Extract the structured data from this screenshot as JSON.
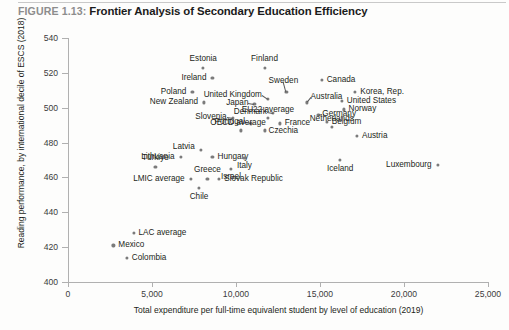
{
  "figure": {
    "label": "FIGURE 1.13:",
    "title": "Frontier Analysis of Secondary Education Efficiency"
  },
  "chart_data": {
    "type": "scatter",
    "title": "Frontier Analysis of Secondary Education Efficiency",
    "xlabel": "Total expenditure per full-time equivalent student by level of education (2019)",
    "ylabel": "Reading performance, by international decile of ESCS (2018)",
    "xlim": [
      0,
      25000
    ],
    "ylim": [
      400,
      540
    ],
    "xticks": [
      "0",
      "5,000",
      "10,000",
      "15,000",
      "20,000",
      "25,000"
    ],
    "xtick_values": [
      0,
      5000,
      10000,
      15000,
      20000,
      25000
    ],
    "yticks": [
      "400",
      "420",
      "440",
      "460",
      "480",
      "500",
      "520",
      "540"
    ],
    "ytick_values": [
      400,
      420,
      440,
      460,
      480,
      500,
      520,
      540
    ],
    "grid": false,
    "legend": null,
    "marker_color": "#7b7b7b",
    "points": [
      {
        "name": "Estonia",
        "x": 8050,
        "y": 523,
        "label_dx": 0,
        "label_dy": -9,
        "align": "c",
        "leader": false
      },
      {
        "name": "Finland",
        "x": 11700,
        "y": 523,
        "label_dx": 0,
        "label_dy": -9,
        "align": "c",
        "leader": false
      },
      {
        "name": "Ireland",
        "x": 8600,
        "y": 517,
        "label_dx": -6,
        "label_dy": 0,
        "align": "r",
        "leader": false
      },
      {
        "name": "Canada",
        "x": 15100,
        "y": 516,
        "label_dx": 5,
        "label_dy": 0,
        "align": "l",
        "leader": false
      },
      {
        "name": "Korea, Rep.",
        "x": 17100,
        "y": 509,
        "label_dx": 5,
        "label_dy": 0,
        "align": "l",
        "leader": false
      },
      {
        "name": "Poland",
        "x": 7400,
        "y": 509,
        "label_dx": -6,
        "label_dy": 0,
        "align": "r",
        "leader": false
      },
      {
        "name": "Sweden",
        "x": 13000,
        "y": 509,
        "label_dx": -3,
        "label_dy": -11,
        "align": "c",
        "leader": true
      },
      {
        "name": "United Kingdom",
        "x": 11900,
        "y": 505,
        "label_dx": -6,
        "label_dy": -4,
        "align": "r",
        "leader": true
      },
      {
        "name": "United States",
        "x": 16300,
        "y": 504,
        "label_dx": 5,
        "label_dy": 0,
        "align": "l",
        "leader": false
      },
      {
        "name": "New Zealand",
        "x": 8100,
        "y": 503,
        "label_dx": -6,
        "label_dy": 0,
        "align": "r",
        "leader": false
      },
      {
        "name": "Australia",
        "x": 14200,
        "y": 503,
        "label_dx": 4,
        "label_dy": -5,
        "align": "l",
        "leader": true
      },
      {
        "name": "Japan",
        "x": 11100,
        "y": 502,
        "label_dx": -6,
        "label_dy": -1,
        "align": "r",
        "leader": true
      },
      {
        "name": "Norway",
        "x": 16400,
        "y": 499,
        "label_dx": 5,
        "label_dy": 0,
        "align": "l",
        "leader": false
      },
      {
        "name": "Denmark",
        "x": 12200,
        "y": 497,
        "label_dx": -6,
        "label_dy": -1,
        "align": "r",
        "leader": true
      },
      {
        "name": "Germany",
        "x": 14900,
        "y": 496,
        "label_dx": 4,
        "label_dy": -1,
        "align": "l",
        "leader": true
      },
      {
        "name": "EU22 average",
        "x": 11900,
        "y": 494,
        "label_dx": 0,
        "label_dy": -8,
        "align": "c",
        "leader": false
      },
      {
        "name": "Slovenia",
        "x": 9800,
        "y": 494,
        "label_dx": -6,
        "label_dy": -1,
        "align": "r",
        "leader": true
      },
      {
        "name": "Belgium",
        "x": 15400,
        "y": 492,
        "label_dx": 5,
        "label_dy": 0,
        "align": "l",
        "leader": false
      },
      {
        "name": "Portugal",
        "x": 10900,
        "y": 491,
        "label_dx": -6,
        "label_dy": -1,
        "align": "r",
        "leader": true
      },
      {
        "name": "France",
        "x": 12600,
        "y": 491,
        "label_dx": 5,
        "label_dy": 0,
        "align": "l",
        "leader": false
      },
      {
        "name": "Netherlands",
        "x": 15700,
        "y": 489,
        "label_dx": 0,
        "label_dy": -8,
        "align": "c",
        "leader": false
      },
      {
        "name": "Czechia",
        "x": 11700,
        "y": 487,
        "label_dx": 4,
        "label_dy": 1,
        "align": "l",
        "leader": false
      },
      {
        "name": "OECD average",
        "x": 10300,
        "y": 487,
        "label_dx": -3,
        "label_dy": -7,
        "align": "c",
        "leader": false
      },
      {
        "name": "Austria",
        "x": 17200,
        "y": 484,
        "label_dx": 5,
        "label_dy": 0,
        "align": "l",
        "leader": false
      },
      {
        "name": "Latvia",
        "x": 7900,
        "y": 476,
        "label_dx": -6,
        "label_dy": -3,
        "align": "r",
        "leader": false
      },
      {
        "name": "Lithuania",
        "x": 6700,
        "y": 472,
        "label_dx": -6,
        "label_dy": 0,
        "align": "r",
        "leader": false
      },
      {
        "name": "Hungary",
        "x": 8600,
        "y": 472,
        "label_dx": 5,
        "label_dy": 0,
        "align": "l",
        "leader": false
      },
      {
        "name": "Italy",
        "x": 10500,
        "y": 471,
        "label_dx": 0,
        "label_dy": 8,
        "align": "c",
        "leader": false
      },
      {
        "name": "Iceland",
        "x": 16200,
        "y": 470,
        "label_dx": 0,
        "label_dy": 9,
        "align": "c",
        "leader": false
      },
      {
        "name": "Luxembourg",
        "x": 22000,
        "y": 467,
        "label_dx": -6,
        "label_dy": 0,
        "align": "r",
        "leader": false
      },
      {
        "name": "Türkiye",
        "x": 5200,
        "y": 466,
        "label_dx": 0,
        "label_dy": -9,
        "align": "c",
        "leader": false
      },
      {
        "name": "Israel",
        "x": 9700,
        "y": 465,
        "label_dx": 0,
        "label_dy": 8,
        "align": "c",
        "leader": false
      },
      {
        "name": "Greece",
        "x": 8300,
        "y": 459,
        "label_dx": 0,
        "label_dy": -9,
        "align": "c",
        "leader": false
      },
      {
        "name": "Slovak Republic",
        "x": 9000,
        "y": 459,
        "label_dx": 5,
        "label_dy": 0,
        "align": "l",
        "leader": false
      },
      {
        "name": "LMIC average",
        "x": 7300,
        "y": 459,
        "label_dx": -6,
        "label_dy": 0,
        "align": "r",
        "leader": false
      },
      {
        "name": "Chile",
        "x": 7800,
        "y": 454,
        "label_dx": 0,
        "label_dy": 9,
        "align": "c",
        "leader": false
      },
      {
        "name": "LAC average",
        "x": 3900,
        "y": 428,
        "label_dx": 5,
        "label_dy": 0,
        "align": "l",
        "leader": false
      },
      {
        "name": "Mexico",
        "x": 2700,
        "y": 421,
        "label_dx": 5,
        "label_dy": 0,
        "align": "l",
        "leader": false
      },
      {
        "name": "Colombia",
        "x": 3500,
        "y": 414,
        "label_dx": 5,
        "label_dy": 0,
        "align": "l",
        "leader": false
      }
    ]
  }
}
